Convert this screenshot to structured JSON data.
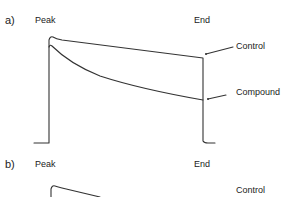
{
  "panels": [
    {
      "id": "a",
      "label": "a)",
      "peak_label": "Peak",
      "end_label": "End",
      "traces": [
        {
          "name": "Control",
          "label": "Control"
        },
        {
          "name": "Compound",
          "label": "Compound"
        }
      ]
    },
    {
      "id": "b",
      "label": "b)",
      "peak_label": "Peak",
      "end_label": "End",
      "traces": [
        {
          "name": "Control",
          "label": "Control"
        }
      ]
    }
  ],
  "colors": {
    "trace": "#333333",
    "text": "#222222"
  }
}
